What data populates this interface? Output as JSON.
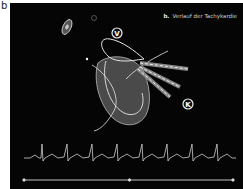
{
  "figure": {
    "panel_letter": "b",
    "title_prefix": "b.",
    "title_text": "Verlauf der Tachykardie",
    "labels": {
      "v": "V",
      "k": "K"
    },
    "ecg": {
      "beats": 8,
      "rhythm": "regular tachycardia"
    },
    "timeline": {
      "segments": 2
    },
    "colors": {
      "background": "#050505",
      "lines": "#e6e6e6",
      "heart_fill": "#4a4a4a"
    }
  }
}
